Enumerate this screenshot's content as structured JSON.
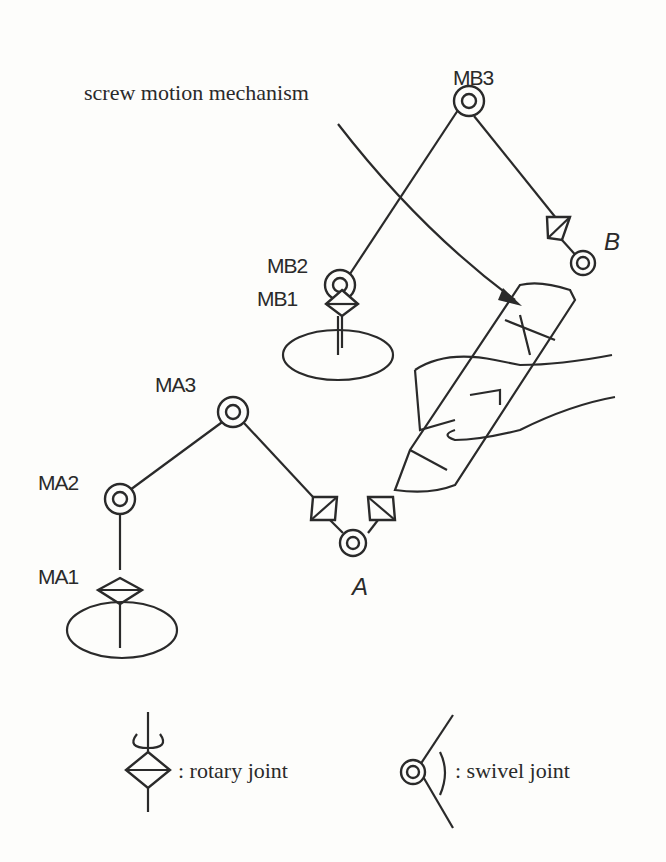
{
  "title": "screw motion mechanism",
  "labels": {
    "mb3": "MB3",
    "mb2": "MB2",
    "mb1": "MB1",
    "ma3": "MA3",
    "ma2": "MA2",
    "ma1": "MA1",
    "a": "A",
    "b": "B"
  },
  "legend": {
    "rotary": ": rotary joint",
    "swivel": ": swivel joint"
  }
}
